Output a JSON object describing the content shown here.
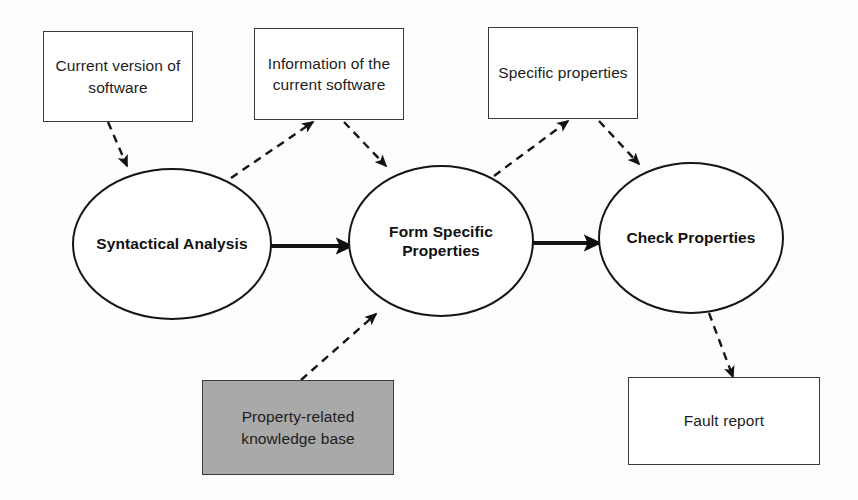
{
  "diagram": {
    "background_color": "#fdfdfc",
    "stroke_color": "#151515",
    "shaded_fill_color": "#a9a9a9",
    "nodes": [
      {
        "id": "current-version-of-software",
        "shape": "rectangle",
        "label": "Current version of\nsoftware",
        "x": 43,
        "y": 31,
        "w": 150,
        "h": 91
      },
      {
        "id": "information-of-the-current-software",
        "shape": "rectangle",
        "label": "Information of the\ncurrent software",
        "x": 254,
        "y": 28,
        "w": 150,
        "h": 92
      },
      {
        "id": "specific-properties",
        "shape": "rectangle",
        "label": "Specific properties",
        "x": 488,
        "y": 27,
        "w": 150,
        "h": 92
      },
      {
        "id": "syntactical-analysis",
        "shape": "ellipse",
        "label": "Syntactical Analysis",
        "x": 72,
        "y": 168,
        "w": 200,
        "h": 152
      },
      {
        "id": "form-specific-properties",
        "shape": "ellipse",
        "label": "Form Specific\nProperties",
        "x": 348,
        "y": 165,
        "w": 186,
        "h": 152
      },
      {
        "id": "check-properties",
        "shape": "ellipse",
        "label": "Check Properties",
        "x": 598,
        "y": 162,
        "w": 186,
        "h": 152
      },
      {
        "id": "property-related-knowledge-base",
        "shape": "rectangle-shaded",
        "label": "Property-related\nknowledge base",
        "x": 202,
        "y": 380,
        "w": 192,
        "h": 95
      },
      {
        "id": "fault-report",
        "shape": "rectangle",
        "label": "Fault report",
        "x": 628,
        "y": 377,
        "w": 192,
        "h": 88
      }
    ],
    "edges": [
      {
        "id": "current-version-to-syntactical-analysis",
        "from": "current-version-of-software",
        "to": "syntactical-analysis",
        "style": "dashed",
        "x1": 108,
        "y1": 122,
        "x2": 127,
        "y2": 166
      },
      {
        "id": "syntactical-analysis-to-information",
        "from": "syntactical-analysis",
        "to": "information-of-the-current-software",
        "style": "dashed",
        "x1": 231,
        "y1": 178,
        "x2": 313,
        "y2": 122
      },
      {
        "id": "information-to-form-specific-properties",
        "from": "information-of-the-current-software",
        "to": "form-specific-properties",
        "style": "dashed",
        "x1": 344,
        "y1": 122,
        "x2": 386,
        "y2": 166
      },
      {
        "id": "form-specific-properties-to-specific-properties",
        "from": "form-specific-properties",
        "to": "specific-properties",
        "style": "dashed",
        "x1": 494,
        "y1": 176,
        "x2": 568,
        "y2": 121
      },
      {
        "id": "specific-properties-to-check-properties",
        "from": "specific-properties",
        "to": "check-properties",
        "style": "dashed",
        "x1": 599,
        "y1": 121,
        "x2": 639,
        "y2": 164
      },
      {
        "id": "knowledge-base-to-form-specific-properties",
        "from": "property-related-knowledge-base",
        "to": "form-specific-properties",
        "style": "dashed",
        "x1": 301,
        "y1": 380,
        "x2": 376,
        "y2": 314
      },
      {
        "id": "check-properties-to-fault-report",
        "from": "check-properties",
        "to": "fault-report",
        "style": "dashed",
        "x1": 709,
        "y1": 313,
        "x2": 733,
        "y2": 377
      },
      {
        "id": "syntactical-analysis-to-form-specific-properties",
        "from": "syntactical-analysis",
        "to": "form-specific-properties",
        "style": "solid",
        "x1": 268,
        "y1": 246,
        "x2": 352,
        "y2": 246
      },
      {
        "id": "form-specific-properties-to-check-properties",
        "from": "form-specific-properties",
        "to": "check-properties",
        "style": "solid",
        "x1": 528,
        "y1": 243,
        "x2": 600,
        "y2": 243
      }
    ]
  }
}
